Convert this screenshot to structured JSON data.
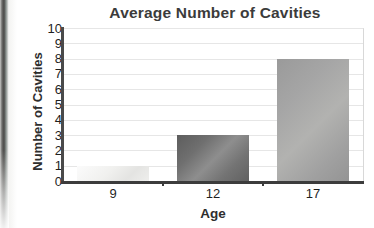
{
  "chart_data": {
    "type": "bar",
    "title": "Average Number of Cavities",
    "xlabel": "Age",
    "ylabel": "Number of Cavities",
    "categories": [
      "9",
      "12",
      "17"
    ],
    "values": [
      1,
      3,
      8
    ],
    "ylim": [
      0,
      10
    ],
    "ytick_labels": [
      "10",
      "9",
      "8",
      "7",
      "6",
      "5",
      "4",
      "3",
      "2",
      "1",
      "0"
    ],
    "grid": "horizontal",
    "legend": "none",
    "series": [
      {
        "name": "Average Number of Cavities",
        "values": [
          1,
          3,
          8
        ]
      }
    ],
    "bar_colors": [
      "#efefed",
      "#747474",
      "#a6a6a6"
    ],
    "axis_color": "#3c3c3c",
    "gridline_color": "#e6e6e6",
    "title_color": "#3b3b3b"
  }
}
